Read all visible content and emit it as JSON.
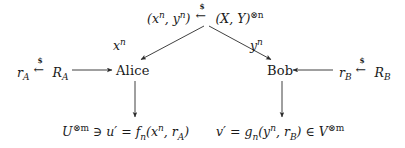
{
  "diagram": {
    "background_color": "#ffffff",
    "stroke_color": "#2b2b2b",
    "text_color": "#1a1a1a",
    "source_label": {
      "left_operand": "(x",
      "left_sup_1": "n",
      "left_mid": ", y",
      "left_sup_2": "n",
      "left_close": ")",
      "sampling_symbol": "$",
      "arrow_glyph": "←",
      "right_operand": "(X, Y)",
      "right_sup": "⊗n",
      "plain_text": "(x^n, y^n) <-$- (X,Y)^{⊗n}"
    },
    "edge_labels": {
      "left_branch": "x",
      "left_branch_sup": "n",
      "right_branch": "y",
      "right_branch_sup": "n"
    },
    "parties": {
      "alice": "Alice",
      "bob": "Bob"
    },
    "randomness": {
      "alice": {
        "var": "r",
        "var_sub": "A",
        "sampling_symbol": "$",
        "arrow_glyph": "←",
        "source": "R",
        "source_sub": "A",
        "plain_text": "r_A <-$- R_A"
      },
      "bob": {
        "var": "r",
        "var_sub": "B",
        "sampling_symbol": "$",
        "arrow_glyph": "←",
        "source": "R",
        "source_sub": "B",
        "plain_text": "r_B <-$- R_B"
      }
    },
    "outputs": {
      "alice": {
        "space": "U",
        "space_sup": "⊗m",
        "membership": "∋",
        "var": "u",
        "prime": "′",
        "equals": "=",
        "func": "f",
        "func_sub": "n",
        "args_open": "(x",
        "args_sup": "n",
        "args_mid": ", r",
        "args_sub": "A",
        "args_close": ")",
        "plain_text": "U^{⊗m} ∋ u′ = f_n(x^n, r_A)"
      },
      "bob": {
        "var": "v",
        "prime": "′",
        "equals": "=",
        "func": "g",
        "func_sub": "n",
        "args_open": "(y",
        "args_sup": "n",
        "args_mid": ", r",
        "args_sub": "B",
        "args_close": ")",
        "membership": "∈",
        "space": "V",
        "space_sup": "⊗m",
        "plain_text": "v′ = g_n(y^n, r_B) ∈ V^{⊗m}"
      }
    },
    "arrows": [
      {
        "name": "source-to-alice",
        "from": [
          205,
          25
        ],
        "to": [
          140,
          60
        ],
        "label": "x^n"
      },
      {
        "name": "source-to-bob",
        "from": [
          208,
          25
        ],
        "to": [
          272,
          60
        ],
        "label": "y^n"
      },
      {
        "name": "randomness-to-alice",
        "from": [
          72,
          70
        ],
        "to": [
          113,
          70
        ],
        "label": ""
      },
      {
        "name": "randomness-to-bob",
        "from": [
          333,
          70
        ],
        "to": [
          292,
          70
        ],
        "label": ""
      },
      {
        "name": "alice-to-output",
        "from": [
          135,
          82
        ],
        "to": [
          135,
          118
        ],
        "label": ""
      },
      {
        "name": "bob-to-output",
        "from": [
          282,
          82
        ],
        "to": [
          282,
          118
        ],
        "label": ""
      }
    ]
  }
}
